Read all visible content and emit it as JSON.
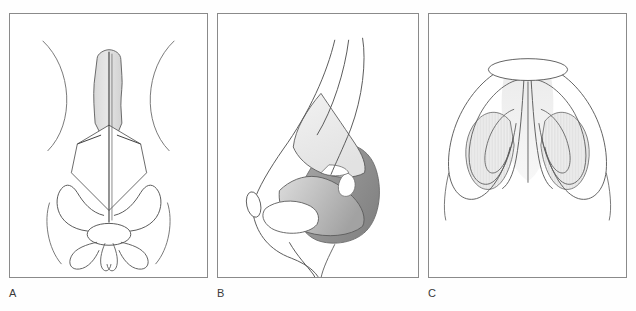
{
  "figure": {
    "background_color": "#fefefe",
    "stroke_color": "#555555",
    "frame_color": "#8a8a8a",
    "label_color": "#3a3a3a",
    "fills": {
      "light_gray": "#e8e8e8",
      "mid_gray": "#c9c9c9",
      "dark_gray": "#9a9a9a",
      "darker_gray": "#8b8b8b",
      "hatch_gray": "#ededed",
      "white": "#ffffff"
    }
  },
  "panels": [
    {
      "id": "a",
      "label": "A",
      "view": "frontal",
      "description": "Frontal (anteroposterior) view of the nose showing the shaded nasal bones / dorsum, the kite-shaped upper lateral cartilages, the midline septal line and the paired lower lateral (alar) cartilages with the tip-defining domes.",
      "structures": [
        "nasal-bone-shaded-dorsum",
        "midline-septum-line",
        "upper-lateral-cartilage-kite",
        "alar-cartilage-left",
        "alar-cartilage-right",
        "tip-dome-ellipse",
        "nostril-loop-left",
        "nostril-loop-right",
        "orbital-arc-left",
        "orbital-arc-right",
        "alar-base-arc"
      ]
    },
    {
      "id": "b",
      "label": "B",
      "view": "lateral",
      "description": "Lateral (profile) view showing the nasal dorsum contour, the triangular upper lateral cartilage, the dark-shaded lateral crus of the lower lateral cartilage, the sesamoid/accessory cartilage highlight and the nostril rim with columella.",
      "structures": [
        "nasal-dorsum-profile-line",
        "nasal-bridge-inner-line",
        "upper-lateral-cartilage-triangle",
        "lateral-crus-shaded",
        "sesamoid-cartilage-highlight",
        "alar-lobule-dark-shading",
        "nostril-rim",
        "columella-line",
        "nasion-ellipse",
        "lip-contour-line"
      ]
    },
    {
      "id": "c",
      "label": "C",
      "view": "basal",
      "description": "Basal (worm's eye) view of the nose showing the columella ellipse at the apex, the paired medial crura descending in the midline, the hatched lateral crura of the lower lateral cartilages and the outer alar rims.",
      "structures": [
        "columella-ellipse",
        "medial-crus-left",
        "medial-crus-right",
        "lateral-crus-hatched-left",
        "lateral-crus-hatched-right",
        "alar-rim-left",
        "alar-rim-right",
        "nostril-outline-left",
        "nostril-outline-right",
        "soft-tissue-triangle"
      ]
    }
  ]
}
